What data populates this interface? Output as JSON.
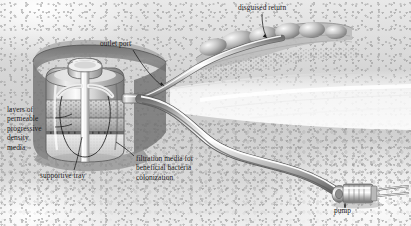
{
  "illustration": {
    "title": "Pond biological filtration system cutaway",
    "style": "grayscale technical illustration",
    "width": 411,
    "height": 226,
    "labels": {
      "outlet_port": "outlet port",
      "disguised_return": "disguised return",
      "layers_media": "layers of\npermeable\nprogressive\ndensity\nmedia",
      "supportive_tray": "supportive tray",
      "filtration_media": "filtration media for\nbeneficial bacteria\ncolonization",
      "pump": "pump"
    },
    "components": {
      "filter_vessel": "filter-vessel",
      "vessel_lid": "vessel-lid",
      "center_standpipe": "center-standpipe",
      "outlet_fitting": "outlet-fitting",
      "media_layer_coarse": "coarse-media-layer",
      "media_layer_medium": "medium-media-layer",
      "media_layer_fine": "fine-media-layer",
      "support_tray": "support-tray",
      "return_hose": "return-hose",
      "suction_hose": "suction-hose",
      "pump_unit": "pump-unit",
      "rock_boulders": "rock-boulders",
      "water_surface": "water-surface",
      "excavation_pit": "excavation-pit"
    },
    "colors": {
      "ink": "#1b1b1b",
      "soil_mid": "#cfcfcf",
      "soil_dark": "#8b8b8b",
      "pit_dark": "#6f6f6f",
      "metal_light": "#f2f2f2",
      "metal_mid": "#b8b8b8",
      "metal_dark": "#6a6a6a",
      "water_white": "#ffffff"
    }
  }
}
